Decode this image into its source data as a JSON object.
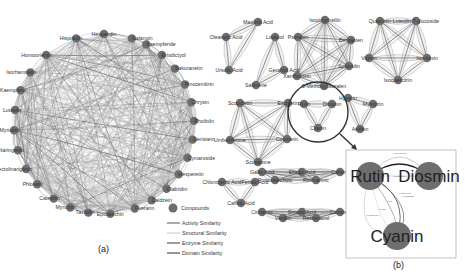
{
  "figure": {
    "panel_a": {
      "label": "(a)",
      "center": [
        104,
        124
      ],
      "radius": 90,
      "nodes": [
        {
          "name": "Hesperidin",
          "angle": -90
        },
        {
          "name": "Hispidulin",
          "angle": -108
        },
        {
          "name": "Galangin",
          "angle": -72
        },
        {
          "name": "Kaempferide",
          "angle": -62
        },
        {
          "name": "Eriodictyol",
          "angle": -50
        },
        {
          "name": "Sakuranetin",
          "angle": -38
        },
        {
          "name": "Pinocembrin",
          "angle": -26
        },
        {
          "name": "Chrysin",
          "angle": -14
        },
        {
          "name": "Rhoifolin",
          "angle": -2
        },
        {
          "name": "Genistein",
          "angle": 10
        },
        {
          "name": "Cymaroside",
          "angle": 22
        },
        {
          "name": "Hesperetin",
          "angle": 34
        },
        {
          "name": "Glabridin",
          "angle": 46
        },
        {
          "name": "Daidzein",
          "angle": 58
        },
        {
          "name": "Puerarin",
          "angle": 70
        },
        {
          "name": "Epicatechin",
          "angle": 86
        },
        {
          "name": "Taxifolin",
          "angle": 100
        },
        {
          "name": "Myricitrin",
          "angle": 112
        },
        {
          "name": "Catechin",
          "angle": 124
        },
        {
          "name": "Phloretin",
          "angle": 138
        },
        {
          "name": "Pectolinarigenin",
          "angle": 150
        },
        {
          "name": "Naringenin",
          "angle": 163
        },
        {
          "name": "Myricetin",
          "angle": 176
        },
        {
          "name": "Luteolin",
          "angle": 189
        },
        {
          "name": "Kaempferol",
          "angle": 202
        },
        {
          "name": "Isorhamnetin",
          "angle": 215
        },
        {
          "name": "Homoorientin",
          "angle": 230
        }
      ]
    },
    "legend": {
      "items": [
        {
          "type": "node",
          "label": "Compounds",
          "color": "#6e6e6e"
        },
        {
          "type": "line",
          "label": "Activity Similarity",
          "color": "#555555"
        },
        {
          "type": "line",
          "label": "Structural Similarity",
          "color": "#c8c8c8"
        },
        {
          "type": "line",
          "label": "Enzyme Similarity",
          "color": "#3a3a3a"
        },
        {
          "type": "line",
          "label": "Domain Similarity",
          "color": "#2a2a2a"
        }
      ]
    },
    "panel_b": {
      "label": "(b)",
      "clusters": [
        {
          "nodes": [
            {
              "name": "Maslinic Acid",
              "x": 258,
              "y": 22
            },
            {
              "name": "Oleanolic Acid",
              "x": 226,
              "y": 37
            },
            {
              "name": "Ursolic Acid",
              "x": 229,
              "y": 70
            }
          ]
        },
        {
          "nodes": [
            {
              "name": "Linalool",
              "x": 275,
              "y": 37
            },
            {
              "name": "Geraniol Acid",
              "x": 284,
              "y": 70
            },
            {
              "name": "Sabinene",
              "x": 256,
              "y": 85
            }
          ]
        },
        {
          "nodes": [
            {
              "name": "Isopimpinellin",
              "x": 325,
              "y": 20
            },
            {
              "name": "Psoralen",
              "x": 298,
              "y": 37
            },
            {
              "name": "Bergapten",
              "x": 351,
              "y": 40
            },
            {
              "name": "Xanthotoxin",
              "x": 297,
              "y": 76
            },
            {
              "name": "Sphondin",
              "x": 349,
              "y": 66
            },
            {
              "name": "5-Methoxypsoralen",
              "x": 324,
              "y": 86
            }
          ]
        },
        {
          "nodes": [
            {
              "name": "Quercetin",
              "x": 380,
              "y": 21
            },
            {
              "name": "Luteolin-7-glucoside",
              "x": 416,
              "y": 21
            },
            {
              "name": "Vitexin",
              "x": 369,
              "y": 58
            },
            {
              "name": "Isovitexin",
              "x": 427,
              "y": 58
            },
            {
              "name": "Isoquercitrin",
              "x": 398,
              "y": 80
            }
          ]
        },
        {
          "nodes": [
            {
              "name": "Scopoletin",
              "x": 240,
              "y": 103
            },
            {
              "name": "Esculetin",
              "x": 288,
              "y": 103
            },
            {
              "name": "Umbelliferone",
              "x": 230,
              "y": 140
            },
            {
              "name": "Coumarin",
              "x": 287,
              "y": 139
            },
            {
              "name": "Scoparone",
              "x": 258,
              "y": 162
            }
          ]
        },
        {
          "nodes": [
            {
              "name": "Rutin",
              "x": 304,
              "y": 104
            },
            {
              "name": "Diosmin",
              "x": 332,
              "y": 104
            },
            {
              "name": "Cyanin",
              "x": 318,
              "y": 128
            }
          ]
        },
        {
          "nodes": [
            {
              "name": "Hyperin",
              "x": 348,
              "y": 98
            },
            {
              "name": "Myricitrin",
              "x": 373,
              "y": 104
            },
            {
              "name": "Astilbin",
              "x": 360,
              "y": 129
            }
          ]
        },
        {
          "nodes": [
            {
              "name": "Chlorogenic Acid",
              "x": 222,
              "y": 182
            },
            {
              "name": "Ferulic Acid",
              "x": 255,
              "y": 182
            },
            {
              "name": "Caffeic Acid",
              "x": 241,
              "y": 203
            }
          ]
        },
        {
          "nodes": [
            {
              "name": "Gallic Acid",
              "x": 262,
              "y": 172
            },
            {
              "name": "Protocatechuic",
              "x": 275,
              "y": 180
            },
            {
              "name": "Ellagic Acid",
              "x": 302,
              "y": 172
            },
            {
              "name": "Rosmarinic",
              "x": 316,
              "y": 180
            },
            {
              "name": "Caftaric",
              "x": 340,
              "y": 172
            }
          ]
        },
        {
          "nodes": [
            {
              "name": "Cinnamic",
              "x": 262,
              "y": 212
            },
            {
              "name": "Vanillin",
              "x": 283,
              "y": 218
            },
            {
              "name": "Sinapic Acid",
              "x": 302,
              "y": 212
            },
            {
              "name": "Resveratrol",
              "x": 316,
              "y": 218
            },
            {
              "name": "Carnosol",
              "x": 340,
              "y": 212
            }
          ]
        }
      ],
      "highlight_circle": {
        "cx": 318,
        "cy": 112,
        "r": 30
      },
      "inset": {
        "box": [
          346,
          150,
          110,
          108
        ],
        "nodes": [
          {
            "name": "Rutin",
            "x": 370,
            "y": 176
          },
          {
            "name": "Diosmin",
            "x": 429,
            "y": 176
          },
          {
            "name": "Cyanin",
            "x": 397,
            "y": 236
          }
        ],
        "edge_labels": [
          "0.86984417",
          "0.60305704",
          "0.5654442",
          "0.8785785",
          "0.51",
          "0.06597394",
          "0.4955"
        ]
      }
    }
  }
}
